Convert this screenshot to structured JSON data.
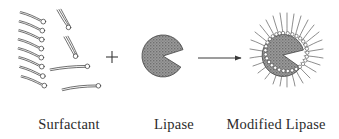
{
  "figure": {
    "background_color": "#ffffff",
    "ink_color": "#3a3a3a",
    "protein_fill_color": "#8d8d8d",
    "protein_edge_color": "#4a4a4a",
    "head_fill_color": "#ffffff"
  },
  "labels": {
    "surfactant": "Surfactant",
    "lipase": "Lipase",
    "modified_lipase": "Modified Lipase"
  },
  "operators": {
    "plus": "+",
    "arrow": "→"
  },
  "scheme": {
    "reactant_a": {
      "name": "surfactant",
      "description": "amphiphilic molecules: small circular head with long curved hydrocarbon tail",
      "stacked_count": 8,
      "free_count": 4,
      "head_radius": 2.4
    },
    "reactant_b": {
      "name": "lipase",
      "description": "pac-man shaped enzyme globule with open active-site wedge facing right",
      "center_x": 163,
      "center_y": 56,
      "radius": 21,
      "wedge_start_deg": -18,
      "wedge_end_deg": 32
    },
    "product": {
      "name": "modified-lipase",
      "description": "lipase globule coated with a ring of surfactant heads, tails radiating outward",
      "center_x": 283,
      "center_y": 55,
      "radius": 21,
      "wedge_start_deg": -14,
      "wedge_end_deg": 34,
      "coating_count": 34
    }
  }
}
